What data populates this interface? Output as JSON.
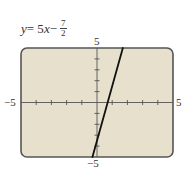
{
  "equation": {
    "lhs": "y",
    "eq": " = 5",
    "x": "x",
    "minus": " − ",
    "numerator": "7",
    "denominator": "2"
  },
  "axis_labels": {
    "y_max": "5",
    "y_min": "−5",
    "x_min": "−5",
    "x_max": "5"
  },
  "colors": {
    "screen_bg": "#e6e0cc",
    "frame": "#555555",
    "line": "#111111"
  },
  "chart_data": {
    "type": "line",
    "xlabel": "",
    "ylabel": "",
    "xlim": [
      -5,
      5
    ],
    "ylim": [
      -5,
      5
    ],
    "xticks_step": 1,
    "yticks_step": 1,
    "grid": false,
    "series": [
      {
        "name": "y = 5x − 7/2",
        "slope": 5,
        "intercept": -3.5,
        "x": [
          -0.3,
          1.7
        ],
        "y": [
          -5,
          5
        ]
      }
    ],
    "tick_labels": {
      "x": [
        "−5",
        "5"
      ],
      "y": [
        "−5",
        "5"
      ]
    }
  }
}
